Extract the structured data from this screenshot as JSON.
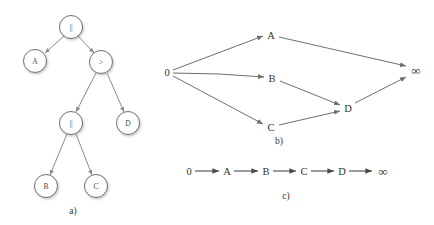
{
  "figure": {
    "background": "#ffffff",
    "stroke_color": "#6e6e6e",
    "text_color": "#333333",
    "panels": [
      {
        "id": "a",
        "caption": "a)"
      },
      {
        "id": "b",
        "caption": "b)"
      },
      {
        "id": "c",
        "caption": "c)"
      }
    ]
  },
  "panel_a": {
    "caption": "a)",
    "type": "expression-tree",
    "nodes": [
      {
        "id": "root",
        "label": "||",
        "cx": 71,
        "cy": 27
      },
      {
        "id": "leafA",
        "label": "A",
        "cx": 35,
        "cy": 61
      },
      {
        "id": "gt",
        "label": ">",
        "cx": 101,
        "cy": 62
      },
      {
        "id": "or2",
        "label": "||",
        "cx": 71,
        "cy": 123
      },
      {
        "id": "leafD",
        "label": "D",
        "cx": 128,
        "cy": 123
      },
      {
        "id": "leafB",
        "label": "B",
        "cx": 46,
        "cy": 186
      },
      {
        "id": "leafC",
        "label": "C",
        "cx": 96,
        "cy": 186
      }
    ],
    "edges": [
      {
        "from": "root",
        "to": "leafA"
      },
      {
        "from": "root",
        "to": "gt"
      },
      {
        "from": "gt",
        "to": "or2"
      },
      {
        "from": "gt",
        "to": "leafD"
      },
      {
        "from": "or2",
        "to": "leafB"
      },
      {
        "from": "or2",
        "to": "leafC"
      }
    ],
    "node_radius": 11.5
  },
  "panel_b": {
    "caption": "b)",
    "type": "directed-acyclic-graph",
    "nodes": [
      {
        "id": "zero",
        "label": "0",
        "x": 167,
        "y": 72
      },
      {
        "id": "A",
        "label": "A",
        "x": 271,
        "y": 35
      },
      {
        "id": "B",
        "label": "B",
        "x": 272,
        "y": 78
      },
      {
        "id": "C",
        "label": "C",
        "x": 271,
        "y": 127
      },
      {
        "id": "D",
        "label": "D",
        "x": 348,
        "y": 108
      },
      {
        "id": "inf",
        "label": "∞",
        "x": 416,
        "y": 70
      }
    ],
    "edges": [
      {
        "from": "zero",
        "to": "A"
      },
      {
        "from": "zero",
        "to": "B"
      },
      {
        "from": "zero",
        "to": "C"
      },
      {
        "from": "A",
        "to": "inf"
      },
      {
        "from": "B",
        "to": "D"
      },
      {
        "from": "C",
        "to": "D"
      },
      {
        "from": "D",
        "to": "inf"
      }
    ]
  },
  "panel_c": {
    "caption": "c)",
    "type": "linear-chain",
    "baseline_y": 171,
    "nodes": [
      {
        "id": "zero",
        "label": "0",
        "x": 189
      },
      {
        "id": "A",
        "label": "A",
        "x": 227
      },
      {
        "id": "B",
        "label": "B",
        "x": 266
      },
      {
        "id": "C",
        "label": "C",
        "x": 304
      },
      {
        "id": "D",
        "label": "D",
        "x": 342
      },
      {
        "id": "inf",
        "label": "∞",
        "x": 382
      }
    ],
    "edges": [
      {
        "from": "zero",
        "to": "A"
      },
      {
        "from": "A",
        "to": "B"
      },
      {
        "from": "B",
        "to": "C"
      },
      {
        "from": "C",
        "to": "D"
      },
      {
        "from": "D",
        "to": "inf"
      }
    ]
  }
}
